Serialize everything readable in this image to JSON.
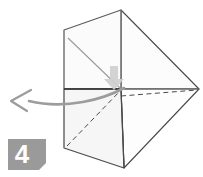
{
  "diagram": {
    "step_badge": {
      "label": "4",
      "background_color": "#9a9a9a",
      "text_color": "#ffffff"
    },
    "colors": {
      "paper_fill": "#fbfbfb",
      "paper_fill_shaded": "#f2f2f2",
      "paper_fill_light": "#fdfdfd",
      "outline": "#3a3a3a",
      "soft_outline": "#8c8c8c",
      "crease_solid": "#9a9a9a",
      "crease_dashed": "#4a4a4a",
      "motion_arrow": "#9c9c9c",
      "fold_arrow": "#c9c9c9",
      "background": "#ffffff"
    },
    "shapes": {
      "upper_panel": {
        "name": "upper-square-panel",
        "points": "64,30 121,10 121,89 64,89",
        "fill": "#fbfbfb"
      },
      "lower_panel": {
        "name": "lower-square-panel",
        "points": "64,89 121,89 124,168 64,148",
        "fill": "#f6f6f6"
      },
      "upper_right_triangle": {
        "name": "upper-right-wing-triangle",
        "points": "121,10 199,89 121,89",
        "fill": "#fcfcfc"
      },
      "lower_right_triangle": {
        "name": "lower-right-wing-triangle",
        "points": "121,89 199,89 124,168",
        "fill": "#fdfdfd"
      }
    },
    "creases": [
      {
        "name": "upper-panel-diagonal-crease",
        "style": "solid",
        "from": "68,38",
        "to": "121,89"
      },
      {
        "name": "lower-panel-diagonal-crease",
        "style": "dashed",
        "from": "67,146",
        "to": "121,90"
      },
      {
        "name": "lower-right-valley-fold-crease",
        "style": "dashed",
        "from": "121,96",
        "to": "197,90"
      }
    ],
    "arrows": {
      "motion_arrow": {
        "name": "fold-direction-arrow",
        "description": "curved arrow sweeping left with open V arrowhead",
        "color": "#9c9c9c",
        "tail_path": "M124,88 C100,99 60,109 28,101",
        "head_path": "M30,91 L12,101 L26,110"
      },
      "fold_arrow": {
        "name": "downward-fold-arrow",
        "description": "gray block arrow pointing down at panel center",
        "color": "#c9c9c9",
        "path": "M110,66 L118,66 L118,79 L123,79 L114,89 L105,79 L110,79 Z"
      }
    },
    "badge_geometry": {
      "name": "step-badge-shape",
      "points": "8,139 46,139 46,164 40,170 8,170",
      "text_position": {
        "x": 23,
        "y": 162
      }
    }
  }
}
